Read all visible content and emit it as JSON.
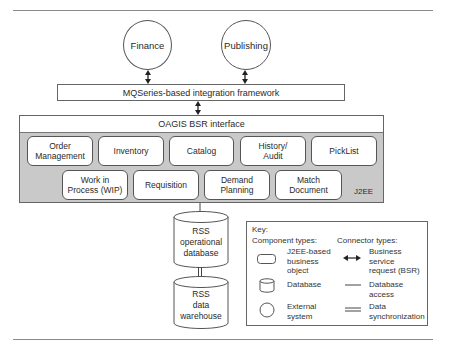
{
  "external_systems": [
    {
      "label": "Finance"
    },
    {
      "label": "Publishing"
    }
  ],
  "integration_framework": {
    "label": "MQSeries-based integration framework"
  },
  "oagis_interface": {
    "label": "OAGIS BSR interface"
  },
  "j2ee_container": {
    "label": "J2EE",
    "row1": [
      {
        "label": "Order\nManagement"
      },
      {
        "label": "Inventory"
      },
      {
        "label": "Catalog"
      },
      {
        "label": "History/\nAudit"
      },
      {
        "label": "PickList"
      }
    ],
    "row2": [
      {
        "label": "Work in\nProcess (WIP)"
      },
      {
        "label": "Requisition"
      },
      {
        "label": "Demand\nPlanning"
      },
      {
        "label": "Match\nDocument"
      }
    ]
  },
  "databases": [
    {
      "label": "RSS\noperational\ndatabase"
    },
    {
      "label": "RSS\ndata\nwarehouse"
    }
  ],
  "key": {
    "title": "Key:",
    "component_types_heading": "Component types:",
    "connector_types_heading": "Connector types:",
    "component_types": [
      {
        "icon": "rounded-rect",
        "label": "J2EE-based\nbusiness\nobject"
      },
      {
        "icon": "cylinder",
        "label": "Database"
      },
      {
        "icon": "circle",
        "label": "External\nsystem"
      }
    ],
    "connector_types": [
      {
        "icon": "double-arrow",
        "label": "Business service\nrequest (BSR)"
      },
      {
        "icon": "single-line",
        "label": "Database access"
      },
      {
        "icon": "double-line",
        "label": "Data\nsynchronization"
      }
    ]
  },
  "colors": {
    "container_fill": "#c9c9c9",
    "stroke": "#555555",
    "rule": "#8a8a8a"
  }
}
